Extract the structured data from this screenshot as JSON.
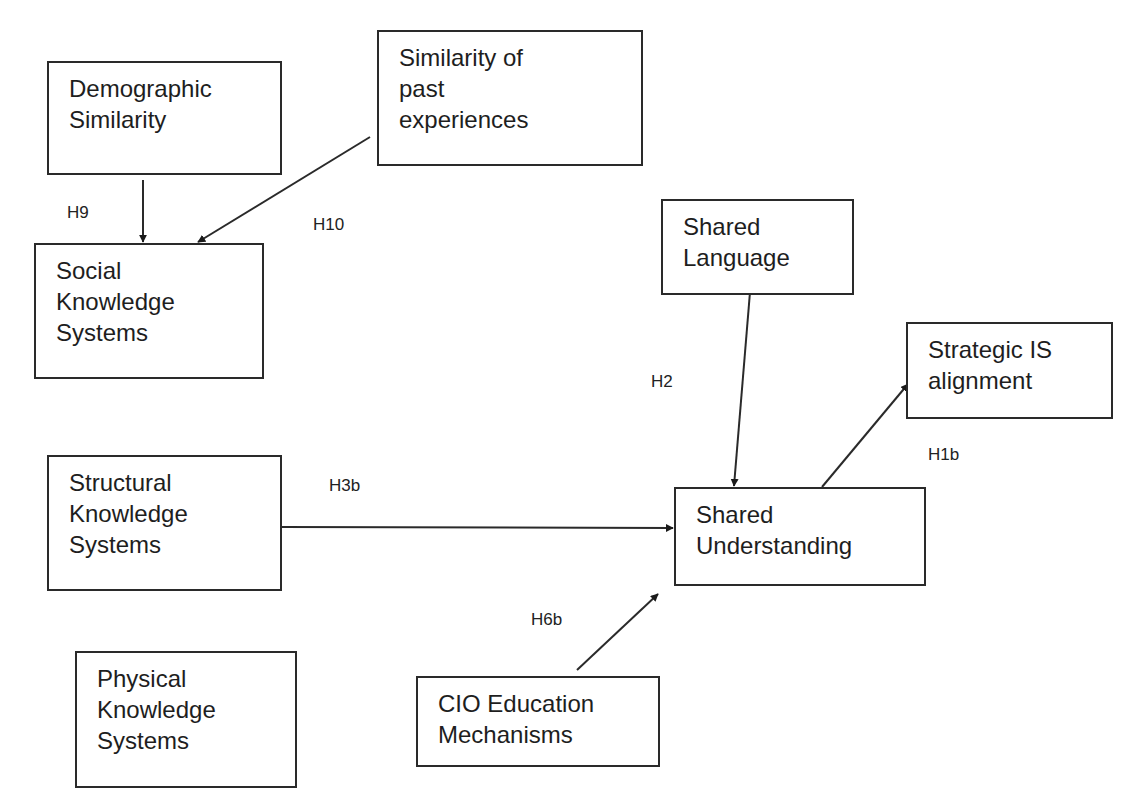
{
  "diagram": {
    "type": "research-model",
    "nodes": [
      {
        "id": "demographic",
        "lines": [
          "Demographic",
          "Similarity"
        ],
        "box": [
          47,
          61,
          235,
          114
        ]
      },
      {
        "id": "past-exp",
        "lines": [
          "Similarity of",
          "past",
          "experiences"
        ],
        "box": [
          377,
          30,
          266,
          136
        ]
      },
      {
        "id": "social",
        "lines": [
          "Social",
          "Knowledge",
          "Systems"
        ],
        "box": [
          34,
          243,
          230,
          136
        ]
      },
      {
        "id": "shared-lang",
        "lines": [
          "Shared",
          "Language"
        ],
        "box": [
          661,
          199,
          193,
          96
        ]
      },
      {
        "id": "strategic",
        "lines": [
          "Strategic IS",
          "alignment"
        ],
        "box": [
          906,
          322,
          207,
          97
        ]
      },
      {
        "id": "structural",
        "lines": [
          "Structural",
          "Knowledge",
          "Systems"
        ],
        "box": [
          47,
          455,
          235,
          136
        ]
      },
      {
        "id": "shared-und",
        "lines": [
          "Shared",
          "Understanding"
        ],
        "box": [
          674,
          487,
          252,
          99
        ]
      },
      {
        "id": "physical",
        "lines": [
          "Physical",
          "Knowledge",
          "Systems"
        ],
        "box": [
          75,
          651,
          222,
          137
        ]
      },
      {
        "id": "cio-edu",
        "lines": [
          "CIO Education",
          "Mechanisms"
        ],
        "box": [
          416,
          676,
          244,
          91
        ]
      }
    ],
    "edges": [
      {
        "id": "H9",
        "label": "H9",
        "from": "demographic",
        "to": "social",
        "path": [
          143,
          180,
          143,
          242
        ],
        "label_pos": [
          67,
          203
        ]
      },
      {
        "id": "H10",
        "label": "H10",
        "from": "past-exp",
        "to": "social",
        "path": [
          370,
          137,
          198,
          242
        ],
        "label_pos": [
          313,
          215
        ]
      },
      {
        "id": "H2",
        "label": "H2",
        "from": "shared-lang",
        "to": "shared-und",
        "path": [
          750,
          292,
          734,
          486
        ],
        "label_pos": [
          651,
          372
        ]
      },
      {
        "id": "H1b",
        "label": "H1b",
        "from": "shared-und",
        "to": "strategic",
        "path": [
          822,
          487,
          908,
          384
        ],
        "label_pos": [
          928,
          445
        ]
      },
      {
        "id": "H3b",
        "label": "H3b",
        "from": "structural",
        "to": "shared-und",
        "path": [
          281,
          527,
          673,
          528
        ],
        "label_pos": [
          329,
          476
        ]
      },
      {
        "id": "H6b",
        "label": "H6b",
        "from": "cio-edu",
        "to": "shared-und",
        "path": [
          577,
          670,
          658,
          594
        ],
        "label_pos": [
          531,
          610
        ]
      }
    ],
    "colors": {
      "stroke": "#2a2a2a",
      "text": "#1e1e1e",
      "background": "#ffffff"
    }
  }
}
